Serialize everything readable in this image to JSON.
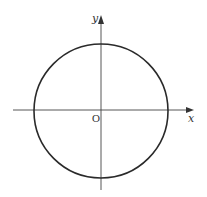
{
  "diagram": {
    "type": "coordinate-plane-circle",
    "labels": {
      "x_axis": "x",
      "y_axis": "y",
      "origin": "O"
    },
    "geometry": {
      "origin": [
        101,
        110
      ],
      "circle_center": [
        101,
        111
      ],
      "circle_radius": 67,
      "x_axis_from": 13,
      "x_axis_to": 193,
      "y_axis_from": 190,
      "y_axis_to": 16
    },
    "colors": {
      "stroke": "#333333",
      "circle_stroke": "#2a2a2a",
      "background": "#ffffff"
    }
  }
}
